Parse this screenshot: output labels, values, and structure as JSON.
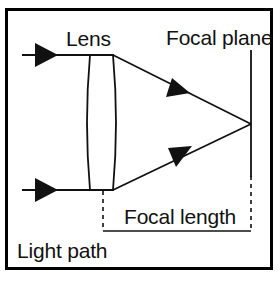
{
  "diagram": {
    "title": "Light path",
    "type": "optical-ray-diagram",
    "labels": {
      "lens": "Lens",
      "focal_plane": "Focal plane",
      "focal_length": "Focal length",
      "light_path": "Light path"
    },
    "colors": {
      "stroke": "#111111",
      "background": "#ffffff",
      "border": "#000000"
    },
    "elements": {
      "border": {
        "x": 5,
        "y": 8,
        "width": 268,
        "height": 262,
        "stroke_width": 3
      },
      "lens": {
        "shape": "biconvex",
        "top_y": 55,
        "bottom_y": 190,
        "left_x": 90,
        "right_x": 113,
        "bulge": 5
      },
      "incoming_rays": [
        {
          "name": "upper-incoming-ray",
          "y": 55,
          "x_start": 22,
          "x_end": 90,
          "arrow_tip_x": 57
        },
        {
          "name": "lower-incoming-ray",
          "y": 190,
          "x_start": 22,
          "x_end": 90,
          "arrow_tip_x": 57
        }
      ],
      "converging_rays": [
        {
          "name": "upper-converging-ray",
          "x1": 113,
          "y1": 55,
          "x2": 251,
          "y2": 124,
          "arrow_tip_x": 190,
          "arrow_tip_y": 93
        },
        {
          "name": "lower-converging-ray",
          "x1": 113,
          "y1": 190,
          "x2": 251,
          "y2": 124,
          "arrow_tip_x": 190,
          "arrow_tip_y": 162
        }
      ],
      "focal_point": {
        "x": 251,
        "y": 124
      },
      "focal_plane_line": {
        "x": 251,
        "y_top": 50,
        "y_bottom": 176,
        "dashed_to_y": 231
      },
      "focal_length_measure": {
        "left_x": 103,
        "right_x": 251,
        "baseline_y": 231,
        "tick_top_y": 190
      }
    }
  }
}
